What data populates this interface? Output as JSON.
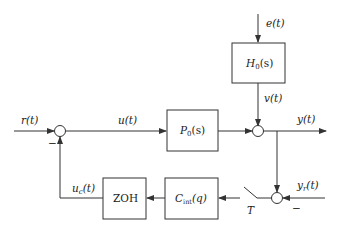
{
  "diagram": {
    "type": "block-diagram",
    "blocks": [
      {
        "id": "H0",
        "label": "H",
        "sub": "0",
        "arg": "(s)"
      },
      {
        "id": "P0",
        "label": "P",
        "sub": "0",
        "arg": "(s)"
      },
      {
        "id": "Cint",
        "label": "C",
        "sub": "int",
        "arg": "(q)"
      },
      {
        "id": "ZOH",
        "label": "ZOH"
      }
    ],
    "signals": {
      "e": "e(t)",
      "v": "v(t)",
      "r": "r(t)",
      "u": "u(t)",
      "y": "y(t)",
      "yr_main": "y",
      "yr_sub": "r",
      "yr_arg": "(t)",
      "uc_main": "u",
      "uc_sub": "c",
      "uc_arg": "(t)"
    },
    "switch_label": "T",
    "minus_sign": "−",
    "colors": {
      "line": "#333333",
      "background": "#ffffff"
    }
  }
}
